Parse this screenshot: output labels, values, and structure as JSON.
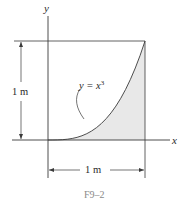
{
  "figure": {
    "caption": "F9–2",
    "x_axis_label": "x",
    "y_axis_label": "y",
    "curve_equation": {
      "prefix": "y = x",
      "exponent": "3"
    },
    "vertical_dimension": "1 m",
    "horizontal_dimension": "1 m"
  },
  "colors": {
    "line": "#3a3a3a",
    "shade": "#e8e8e8",
    "caption": "#8a8a8a"
  }
}
